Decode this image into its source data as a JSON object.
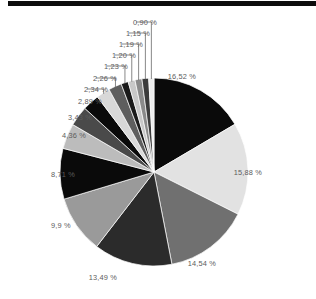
{
  "figure": {
    "type": "pie-chart-figure",
    "top_rule_color": "#0d0d0d",
    "label_color": "#5c5c5c",
    "background": "#ffffff"
  },
  "chart_data": {
    "type": "pie",
    "title": "",
    "xlabel": "",
    "ylabel": "",
    "legend": "none",
    "grid": false,
    "value_suffix": " %",
    "decimal_separator": ",",
    "start_angle_deg": 0,
    "direction": "clockwise",
    "center_px": [
      154,
      172
    ],
    "radius_px": 94,
    "categories": [
      "slice-1",
      "slice-2",
      "slice-3",
      "slice-4",
      "slice-5",
      "slice-6",
      "slice-7",
      "slice-8",
      "slice-9",
      "slice-10",
      "slice-11",
      "slice-12",
      "slice-13",
      "slice-14",
      "slice-15",
      "slice-16"
    ],
    "values": [
      16.52,
      15.88,
      14.54,
      13.49,
      9.9,
      8.71,
      4.36,
      3.43,
      2.89,
      2.34,
      2.26,
      1.23,
      1.2,
      1.19,
      1.15,
      0.9
    ],
    "labels": [
      "16,52 %",
      "15,88 %",
      "14,54 %",
      "13,49 %",
      "9,9 %",
      "8,71 %",
      "4,36 %",
      "3,43 %",
      "2,89 %",
      "2,34 %",
      "2,26 %",
      "1,23 %",
      "1,20 %",
      "1,19 %",
      "1,15 %",
      "0,90 %"
    ],
    "colors": [
      "#0a0a0a",
      "#e2e2e2",
      "#707070",
      "#2b2b2b",
      "#9a9a9a",
      "#0a0a0a",
      "#bcbcbc",
      "#4a4a4a",
      "#0a0a0a",
      "#d8d8d8",
      "#5e5e5e",
      "#1a1a1a",
      "#c8c8c8",
      "#8a8a8a",
      "#3a3a3a",
      "#ededed"
    ],
    "total": 100.0
  },
  "labels": {
    "l1": {
      "text": "16,52 %",
      "x": 196,
      "y": 72,
      "align": "left"
    },
    "l2": {
      "text": "15,88 %",
      "x": 262,
      "y": 168,
      "align": "left"
    },
    "l3": {
      "text": "14,54 %",
      "x": 216,
      "y": 259,
      "align": "left"
    },
    "l4": {
      "text": "13,49 %",
      "x": 117,
      "y": 273,
      "align": "left"
    },
    "l5": {
      "text": "9,9 %",
      "x": 51,
      "y": 221,
      "align": "right"
    },
    "l6": {
      "text": "8,71 %",
      "x": 51,
      "y": 170,
      "align": "right"
    },
    "l7": {
      "text": "4,36 %",
      "x": 62,
      "y": 131,
      "align": "right"
    },
    "l8": {
      "text": "3,43 %",
      "x": 68,
      "y": 113,
      "align": "right"
    },
    "l9": {
      "text": "2,89 %",
      "x": 78,
      "y": 97,
      "align": "right"
    },
    "l10": {
      "text": "2,34 %",
      "x": 84,
      "y": 85,
      "align": "right"
    },
    "l11": {
      "text": "2,26 %",
      "x": 93,
      "y": 74,
      "align": "right"
    },
    "l12": {
      "text": "1,23 %",
      "x": 104,
      "y": 62,
      "align": "right"
    },
    "l13": {
      "text": "1,20 %",
      "x": 112,
      "y": 51,
      "align": "right"
    },
    "l14": {
      "text": "1,19 %",
      "x": 119,
      "y": 40,
      "align": "right"
    },
    "l15": {
      "text": "1,15 %",
      "x": 126,
      "y": 29,
      "align": "right"
    },
    "l16": {
      "text": "0,90 %",
      "x": 133,
      "y": 18,
      "align": "right"
    }
  }
}
